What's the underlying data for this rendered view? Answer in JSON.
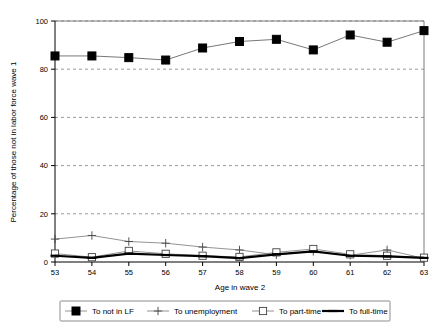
{
  "chart_data": {
    "type": "line",
    "title": "",
    "xlabel": "Age in wave 2",
    "ylabel": "Percentage of those not in labor force wave 1",
    "categories": [
      "53",
      "54",
      "55",
      "56",
      "57",
      "58",
      "59",
      "60",
      "61",
      "62",
      "63"
    ],
    "x": [
      53,
      54,
      55,
      56,
      57,
      58,
      59,
      60,
      61,
      62,
      63
    ],
    "ylim": [
      0,
      100
    ],
    "yticks": [
      0,
      20,
      40,
      60,
      80,
      100
    ],
    "grid": "horizontal-dashed",
    "legend_position": "bottom",
    "series": [
      {
        "name": "To not in LF",
        "marker": "filled-square",
        "values": [
          85.5,
          85.5,
          84.8,
          83.8,
          88.8,
          91.5,
          92.4,
          88.0,
          94.2,
          91.2,
          96.0
        ]
      },
      {
        "name": "To unemployment",
        "marker": "plus",
        "values": [
          9.5,
          11.0,
          8.5,
          7.8,
          6.2,
          5.0,
          3.0,
          4.4,
          2.8,
          5.0,
          1.5
        ]
      },
      {
        "name": "To part-time",
        "marker": "open-square",
        "values": [
          3.5,
          2.0,
          4.6,
          3.4,
          2.6,
          2.1,
          4.0,
          5.4,
          3.2,
          2.6,
          1.8
        ]
      },
      {
        "name": "To full-time",
        "marker": "thick-line",
        "values": [
          2.6,
          1.7,
          3.5,
          2.9,
          2.4,
          1.6,
          3.2,
          4.4,
          2.6,
          2.3,
          1.7
        ]
      }
    ]
  },
  "axes": {
    "y_tick_labels": [
      "0",
      "20",
      "40",
      "60",
      "80",
      "100"
    ],
    "x_tick_labels": [
      "53",
      "54",
      "55",
      "56",
      "57",
      "58",
      "59",
      "60",
      "61",
      "62",
      "63"
    ],
    "x_axis_title": "Age in wave 2",
    "y_axis_title": "Percentage of those not in labor force wave 1"
  },
  "legend": {
    "items": [
      {
        "label": "To not in LF",
        "marker": "filled-square"
      },
      {
        "label": "To unemployment",
        "marker": "plus"
      },
      {
        "label": "To part-time",
        "marker": "open-square"
      },
      {
        "label": "To full-time",
        "marker": "thick-line"
      }
    ]
  },
  "colors": {
    "series_primary": "#000000",
    "gridline": "#9a9a9a",
    "frame": "#7a7a7a",
    "background": "#ffffff"
  }
}
